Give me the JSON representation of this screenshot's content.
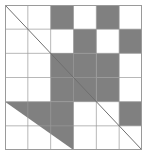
{
  "figure": {
    "kind": "patchwork-quilt-block",
    "canvas": {
      "width": 150,
      "height": 157
    },
    "block": {
      "x": 5,
      "y": 5,
      "width": 137,
      "height": 145
    }
  },
  "colors": {
    "background": "#ffffff",
    "patch_light": "#ffffff",
    "patch_dark": "#808080",
    "outline": "#9a9a9a",
    "diagonal_line": "#6f6f6f"
  },
  "grid": {
    "columns": 6,
    "rows": 6,
    "cell_width": 22.83,
    "cell_height": 24.17,
    "column_edges": [
      0,
      22.83,
      45.67,
      68.5,
      91.33,
      114.17,
      137
    ],
    "row_edges": [
      0,
      24.17,
      48.33,
      72.5,
      96.67,
      120.83,
      145
    ]
  },
  "quadrants": [
    {
      "name": "top-left",
      "unit": "half-square-triangle",
      "fill": "#ffffff",
      "diagonal": "top-left-to-bottom-right",
      "span": {
        "col": 0,
        "row": 0,
        "cols": 3,
        "rows": 3
      }
    },
    {
      "name": "top-right",
      "unit": "checkerboard",
      "span": {
        "col": 3,
        "row": 0,
        "cols": 3,
        "rows": 3
      }
    },
    {
      "name": "bottom-left",
      "unit": "half-square-triangle",
      "fill": "#808080",
      "diagonal": "top-left-to-bottom-right",
      "span": {
        "col": 0,
        "row": 3,
        "cols": 3,
        "rows": 3
      }
    },
    {
      "name": "bottom-right",
      "unit": "half-square-triangle",
      "fill": "#ffffff",
      "diagonal": "top-left-to-bottom-right",
      "span": {
        "col": 3,
        "row": 3,
        "cols": 3,
        "rows": 3
      }
    }
  ],
  "patches": [
    {
      "id": "p-r0c0",
      "row": 0,
      "col": 0,
      "shape": "triangle-lower-left",
      "fill": "#ffffff"
    },
    {
      "id": "p-r0c1",
      "row": 0,
      "col": 1,
      "shape": "square",
      "fill": "#ffffff"
    },
    {
      "id": "p-r0c2",
      "row": 0,
      "col": 2,
      "shape": "square",
      "fill": "#808080"
    },
    {
      "id": "p-r0c3",
      "row": 0,
      "col": 3,
      "shape": "square",
      "fill": "#ffffff"
    },
    {
      "id": "p-r0c4",
      "row": 0,
      "col": 4,
      "shape": "square",
      "fill": "#808080"
    },
    {
      "id": "p-r0c5",
      "row": 0,
      "col": 5,
      "shape": "square",
      "fill": "#ffffff"
    },
    {
      "id": "p-r1c0",
      "row": 1,
      "col": 0,
      "shape": "square",
      "fill": "#ffffff"
    },
    {
      "id": "p-r1c1",
      "row": 1,
      "col": 1,
      "shape": "square",
      "fill": "#ffffff"
    },
    {
      "id": "p-r1c2",
      "row": 1,
      "col": 2,
      "shape": "square",
      "fill": "#ffffff"
    },
    {
      "id": "p-r1c3",
      "row": 1,
      "col": 3,
      "shape": "square",
      "fill": "#808080"
    },
    {
      "id": "p-r1c4",
      "row": 1,
      "col": 4,
      "shape": "square",
      "fill": "#ffffff"
    },
    {
      "id": "p-r1c5",
      "row": 1,
      "col": 5,
      "shape": "square",
      "fill": "#808080"
    },
    {
      "id": "p-r2c0",
      "row": 2,
      "col": 0,
      "shape": "square",
      "fill": "#ffffff"
    },
    {
      "id": "p-r2c1",
      "row": 2,
      "col": 1,
      "shape": "square",
      "fill": "#ffffff"
    },
    {
      "id": "p-r2c2",
      "row": 2,
      "col": 2,
      "shape": "square",
      "fill": "#808080"
    },
    {
      "id": "p-r2c3",
      "row": 2,
      "col": 3,
      "shape": "square",
      "fill": "#ffffff"
    },
    {
      "id": "p-r2c4",
      "row": 2,
      "col": 4,
      "shape": "square",
      "fill": "#808080"
    },
    {
      "id": "p-r2c5",
      "row": 2,
      "col": 5,
      "shape": "square",
      "fill": "#ffffff"
    },
    {
      "id": "p-r3c0",
      "row": 3,
      "col": 0,
      "shape": "square",
      "fill": "#ffffff"
    },
    {
      "id": "p-r3c1",
      "row": 3,
      "col": 1,
      "shape": "square",
      "fill": "#ffffff"
    },
    {
      "id": "p-r3c2",
      "row": 3,
      "col": 2,
      "shape": "square",
      "fill": "#808080"
    },
    {
      "id": "p-r3c3",
      "row": 3,
      "col": 3,
      "shape": "square",
      "fill": "#808080"
    },
    {
      "id": "p-r3c4",
      "row": 3,
      "col": 4,
      "shape": "square",
      "fill": "#ffffff"
    },
    {
      "id": "p-r3c5",
      "row": 3,
      "col": 5,
      "shape": "square",
      "fill": "#808080"
    },
    {
      "id": "p-r4c0",
      "row": 4,
      "col": 0,
      "shape": "triangle-lower-right",
      "fill": "#808080"
    },
    {
      "id": "p-r4c1",
      "row": 4,
      "col": 1,
      "shape": "square",
      "fill": "#808080"
    },
    {
      "id": "p-r4c2",
      "row": 4,
      "col": 2,
      "shape": "square",
      "fill": "#ffffff"
    },
    {
      "id": "p-r4c3",
      "row": 4,
      "col": 3,
      "shape": "square",
      "fill": "#ffffff"
    },
    {
      "id": "p-r4c4",
      "row": 4,
      "col": 4,
      "shape": "square",
      "fill": "#ffffff"
    },
    {
      "id": "p-r4c5",
      "row": 4,
      "col": 5,
      "shape": "square",
      "fill": "#ffffff"
    },
    {
      "id": "p-r5c0",
      "row": 5,
      "col": 0,
      "shape": "square",
      "fill": "#ffffff"
    },
    {
      "id": "p-r5c1",
      "row": 5,
      "col": 1,
      "shape": "triangle-lower-right",
      "fill": "#808080"
    },
    {
      "id": "p-r5c2",
      "row": 5,
      "col": 2,
      "shape": "square",
      "fill": "#ffffff"
    },
    {
      "id": "p-r5c3",
      "row": 5,
      "col": 3,
      "shape": "square",
      "fill": "#ffffff"
    },
    {
      "id": "p-r5c4",
      "row": 5,
      "col": 4,
      "shape": "square",
      "fill": "#ffffff"
    },
    {
      "id": "p-r5c5",
      "row": 5,
      "col": 5,
      "shape": "square",
      "fill": "#ffffff"
    }
  ],
  "shapes": {
    "dark_regions": [
      {
        "name": "top-row-dark-1",
        "type": "rect",
        "x": 45.67,
        "y": 0,
        "w": 22.83,
        "h": 24.17
      },
      {
        "name": "top-row-dark-2",
        "type": "rect",
        "x": 91.33,
        "y": 0,
        "w": 22.83,
        "h": 24.17
      },
      {
        "name": "row2-dark-1",
        "type": "rect",
        "x": 68.5,
        "y": 24.17,
        "w": 22.83,
        "h": 24.17
      },
      {
        "name": "row2-dark-2",
        "type": "rect",
        "x": 114.17,
        "y": 24.17,
        "w": 22.83,
        "h": 24.17
      },
      {
        "name": "row3-dark-1",
        "type": "rect",
        "x": 91.33,
        "y": 48.33,
        "w": 22.83,
        "h": 24.17
      },
      {
        "name": "row3-dark-2",
        "type": "rect",
        "x": 45.67,
        "y": 48.33,
        "w": 22.83,
        "h": 24.17
      },
      {
        "name": "row4-dark-1",
        "type": "rect",
        "x": 91.33,
        "y": 72.5,
        "w": 22.83,
        "h": 24.17
      },
      {
        "name": "row4-dark-2",
        "type": "rect",
        "x": 114.17,
        "y": 96.67,
        "w": 22.83,
        "h": 24.17
      },
      {
        "name": "center-dark-triangle",
        "type": "triangle",
        "points": "45.67,48.33 91.33,48.33 91.33,96.67 45.67,96.67"
      },
      {
        "name": "bottom-left-triangle",
        "type": "triangle",
        "points": "0,96.67 68.5,96.67 68.5,145"
      }
    ],
    "diagonals": [
      {
        "name": "top-left-diagonal",
        "x1": 0,
        "y1": 0,
        "x2": 68.5,
        "y2": 72.5
      },
      {
        "name": "bottom-right-diagonal",
        "x1": 68.5,
        "y1": 72.5,
        "x2": 137,
        "y2": 145
      }
    ]
  }
}
